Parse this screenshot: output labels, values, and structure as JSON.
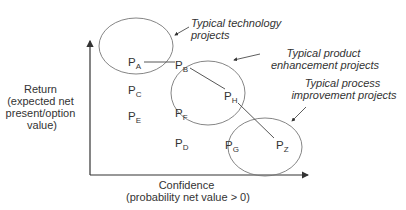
{
  "diagram": {
    "y_axis_label": [
      "Return",
      "(expected net",
      "present/option",
      "value)"
    ],
    "x_axis_label": [
      "Confidence",
      "(probability net value > 0)"
    ],
    "groups": [
      {
        "name": "tech",
        "label": [
          "Typical technology",
          "projects"
        ]
      },
      {
        "name": "product",
        "label": [
          "Typical product",
          "enhancement projects"
        ]
      },
      {
        "name": "process",
        "label": [
          "Typical process",
          "improvement projects"
        ]
      }
    ],
    "points": [
      {
        "id": "A",
        "main": "P",
        "sub": "A"
      },
      {
        "id": "B",
        "main": "P",
        "sub": "B"
      },
      {
        "id": "C",
        "main": "P",
        "sub": "C"
      },
      {
        "id": "E",
        "main": "P",
        "sub": "E"
      },
      {
        "id": "F",
        "main": "P",
        "sub": "F"
      },
      {
        "id": "D",
        "main": "P",
        "sub": "D"
      },
      {
        "id": "H",
        "main": "P",
        "sub": "H"
      },
      {
        "id": "G",
        "main": "P",
        "sub": "G"
      },
      {
        "id": "Z",
        "main": "P",
        "sub": "Z"
      }
    ],
    "colors": {
      "line": "#555555",
      "text": "#333333"
    }
  }
}
